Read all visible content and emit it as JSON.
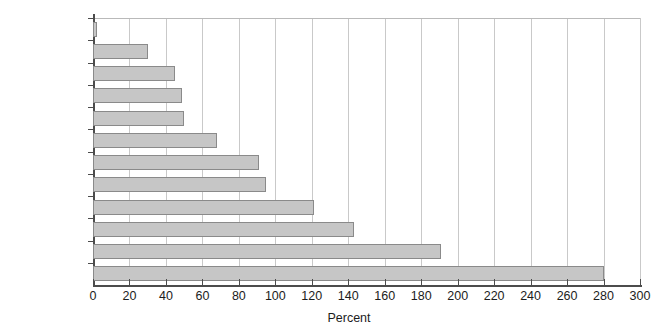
{
  "chart_data": {
    "type": "bar",
    "orientation": "horizontal",
    "title": "",
    "xlabel": "Percent",
    "ylabel": "",
    "xlim": [
      0,
      300
    ],
    "xticks": [
      0,
      20,
      40,
      60,
      80,
      100,
      120,
      140,
      160,
      180,
      200,
      220,
      240,
      260,
      280,
      300
    ],
    "xtick_labels": [
      "0",
      "20",
      "40",
      "60",
      "80",
      "100",
      "120",
      "140",
      "160",
      "180",
      "200",
      "220",
      "240",
      "260",
      "280",
      "300"
    ],
    "grid": "vertical",
    "legend": "none",
    "categories": [
      "Coffee",
      "Lead",
      "Oil",
      "Aluminum",
      "Copper",
      "Zinc",
      "Sugar",
      "Coal",
      "Coarse grains",
      "Oil seeds",
      "Wheat",
      "Cotton"
    ],
    "values": [
      2,
      30,
      45,
      49,
      50,
      68,
      91,
      95,
      121,
      143,
      191,
      280
    ],
    "bar_fill_color": "#c6c6c6",
    "bar_border_color": "#8a8a8a",
    "gridline_color": "#c9c9c9",
    "axis_color": "#4c4c4c",
    "background_color": "#ffffff"
  },
  "axis": {
    "x_title": "Percent"
  },
  "header": {
    "clipped_title": ""
  }
}
